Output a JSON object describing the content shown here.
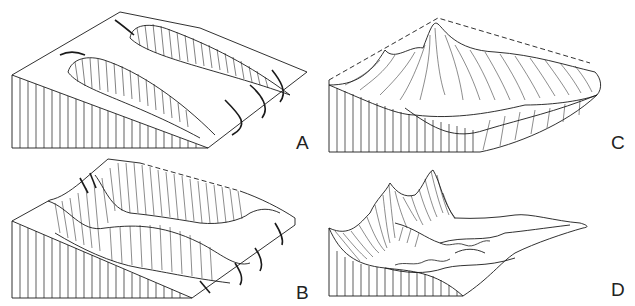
{
  "figure": {
    "line_color": "#1a1a1a",
    "background": "#ffffff",
    "panels": [
      {
        "id": "A",
        "label": "A",
        "content": "Sloping block with two cirque hollows eroded into upland, streams draining toward front edge"
      },
      {
        "id": "B",
        "label": "B",
        "content": "Enlarged cirques coalescing, serrated ridges and dashed former upland surface"
      },
      {
        "id": "C",
        "label": "C",
        "content": "Sharp horn peak and aretes surrounding broad glacial basin, dashed former surface outline"
      },
      {
        "id": "D",
        "label": "D",
        "content": "Mature stage with pointed peaks and wide U-shaped valley floor with meandering streams"
      }
    ]
  }
}
